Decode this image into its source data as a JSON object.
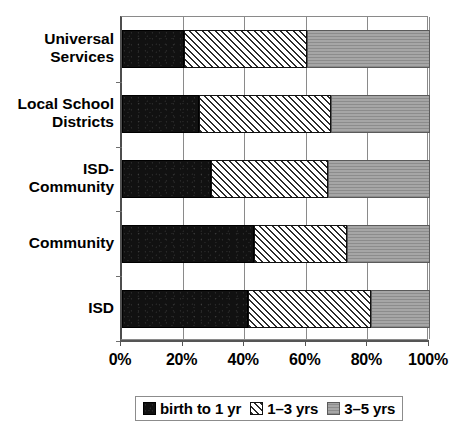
{
  "chart_data": {
    "type": "bar",
    "orientation": "horizontal",
    "stacked": true,
    "normalized": true,
    "title": "",
    "xlabel": "",
    "ylabel": "",
    "xlim": [
      0,
      100
    ],
    "xticks": [
      "0%",
      "20%",
      "40%",
      "60%",
      "80%",
      "100%"
    ],
    "xtick_values": [
      0,
      20,
      40,
      60,
      80,
      100
    ],
    "grid": true,
    "grid_axis": "x",
    "legend_position": "bottom",
    "categories": [
      "Universal Services",
      "Local School Districts",
      "ISD-Community",
      "Community",
      "ISD"
    ],
    "category_lines": [
      [
        "Universal",
        "Services"
      ],
      [
        "Local School",
        "Districts"
      ],
      [
        "ISD-",
        "Community"
      ],
      [
        "Community"
      ],
      [
        "ISD"
      ]
    ],
    "series": [
      {
        "name": "birth to 1 yr",
        "pattern": "solid-black",
        "color": "#111111",
        "values": [
          20,
          25,
          29,
          43,
          41
        ]
      },
      {
        "name": "1–3 yrs",
        "pattern": "diagonal-hatch",
        "color": "#ffffff",
        "values": [
          40,
          43,
          38,
          30,
          40
        ]
      },
      {
        "name": "3–5 yrs",
        "pattern": "gray-horizontal-lines",
        "color": "#9a9a9a",
        "values": [
          40,
          32,
          33,
          27,
          19
        ]
      }
    ]
  },
  "legend": {
    "items": [
      {
        "label": "birth to 1 yr",
        "swatch": "solid-black-swatch"
      },
      {
        "label": "1–3 yrs",
        "swatch": "hatch-swatch"
      },
      {
        "label": "3–5 yrs",
        "swatch": "gray-swatch"
      }
    ]
  },
  "colors": {
    "series_0": "#111111",
    "series_1": "#ffffff",
    "series_2": "#9a9a9a",
    "axis": "#555555",
    "grid": "#8a8a8a",
    "background": "#ffffff"
  }
}
